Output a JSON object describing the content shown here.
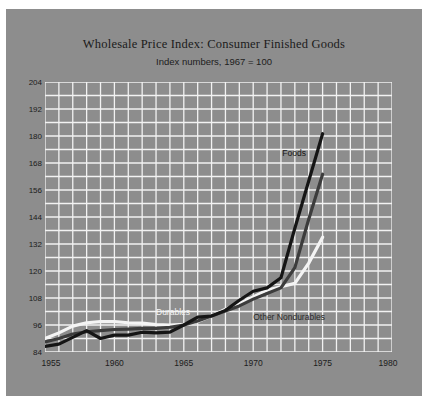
{
  "chart_data": {
    "type": "line",
    "title": "Wholesale Price Index: Consumer Finished Goods",
    "subtitle": "Index numbers, 1967 = 100",
    "xlabel": "",
    "ylabel": "",
    "xlim": [
      1955,
      1980
    ],
    "ylim": [
      84,
      204
    ],
    "grid": true,
    "grid_color": "#f2f2f2",
    "background": "#8d8d8d",
    "legend_position": "inline-annotations",
    "yticks": [
      204,
      192,
      180,
      168,
      156,
      144,
      132,
      120,
      108,
      96,
      84
    ],
    "xticks": [
      1955,
      1960,
      1965,
      1970,
      1975,
      1980
    ],
    "x": [
      1955,
      1956,
      1957,
      1958,
      1959,
      1960,
      1961,
      1962,
      1963,
      1964,
      1965,
      1966,
      1967,
      1968,
      1969,
      1970,
      1971,
      1972,
      1973,
      1974,
      1975
    ],
    "series": [
      {
        "name": "Foods",
        "color": "#151515",
        "width": 3.2,
        "label_x": 1972.1,
        "label_y": 172,
        "label_color": "#151515",
        "values": [
          86.5,
          87.5,
          90.5,
          93.5,
          90.0,
          91.5,
          91.5,
          92.8,
          92.5,
          92.8,
          96.0,
          99.5,
          100.0,
          102.5,
          107.0,
          111.0,
          112.5,
          117.0,
          139.0,
          160.0,
          181.0
        ]
      },
      {
        "name": "Other Nondurables",
        "color": "#3c3c3c",
        "width": 3.2,
        "label_x": 1970.0,
        "label_y": 99,
        "label_color": "#2a2a2a",
        "values": [
          88.5,
          90.0,
          92.0,
          93.0,
          93.5,
          94.0,
          94.2,
          94.5,
          94.5,
          95.0,
          96.0,
          97.8,
          100.0,
          102.2,
          104.5,
          107.5,
          110.0,
          112.5,
          121.5,
          143.0,
          163.0
        ]
      },
      {
        "name": "Durables",
        "color": "#f4f4f4",
        "width": 3.2,
        "label_x": 1963.0,
        "label_y": 101.5,
        "label_color": "#f4f4f4",
        "values": [
          90.0,
          92.5,
          95.5,
          97.0,
          97.5,
          97.5,
          97.0,
          96.8,
          96.2,
          96.0,
          96.3,
          97.5,
          100.0,
          103.0,
          105.5,
          108.5,
          111.5,
          113.0,
          114.5,
          123.5,
          135.0
        ]
      }
    ]
  }
}
